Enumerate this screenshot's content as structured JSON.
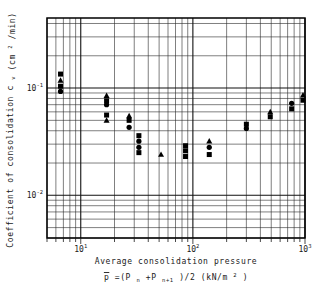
{
  "chart_data": {
    "type": "scatter",
    "title": "",
    "xlabel": "Average consolidation pressure",
    "xlabel_formula_lead": "p",
    "xlabel_formula": "=(P",
    "xlabel_formula_sub1": "n",
    "xlabel_formula_mid": "+P",
    "xlabel_formula_sub2": "n+1",
    "xlabel_formula_tail": ")/2",
    "xlabel_units": "(kN/m",
    "xlabel_units_sup": "2",
    "xlabel_units_tail": ")",
    "ylabel": "Coefficient of consolidation",
    "ylabel_symbol": "c",
    "ylabel_symbol_sub": "v",
    "ylabel_units_open": "(cm",
    "ylabel_units_sup": "2",
    "ylabel_units_close": "/min)",
    "xscale": "log",
    "yscale": "log",
    "xlim": [
      5,
      1000
    ],
    "ylim": [
      0.004,
      0.45
    ],
    "grid": true,
    "legend": "none",
    "xticks": [
      {
        "value": 10,
        "mantissa": "10",
        "exponent": "1"
      },
      {
        "value": 100,
        "mantissa": "10",
        "exponent": "2"
      },
      {
        "value": 1000,
        "mantissa": "10",
        "exponent": "3"
      }
    ],
    "yticks": [
      {
        "value": 0.1,
        "mantissa": "10",
        "exponent": "-1"
      },
      {
        "value": 0.01,
        "mantissa": "10",
        "exponent": "-2"
      }
    ],
    "marker_colors": {
      "all": "#000000"
    },
    "points": [
      {
        "x": 6.6,
        "y": 0.135,
        "marker": "square"
      },
      {
        "x": 6.6,
        "y": 0.118,
        "marker": "triangle"
      },
      {
        "x": 6.6,
        "y": 0.104,
        "marker": "square"
      },
      {
        "x": 6.6,
        "y": 0.093,
        "marker": "circle"
      },
      {
        "x": 17.0,
        "y": 0.085,
        "marker": "triangle"
      },
      {
        "x": 17.0,
        "y": 0.076,
        "marker": "square"
      },
      {
        "x": 17.0,
        "y": 0.07,
        "marker": "circle"
      },
      {
        "x": 17.0,
        "y": 0.056,
        "marker": "square"
      },
      {
        "x": 17.0,
        "y": 0.05,
        "marker": "triangle"
      },
      {
        "x": 27.0,
        "y": 0.055,
        "marker": "triangle"
      },
      {
        "x": 27.0,
        "y": 0.05,
        "marker": "square"
      },
      {
        "x": 27.0,
        "y": 0.043,
        "marker": "circle"
      },
      {
        "x": 33.0,
        "y": 0.036,
        "marker": "square"
      },
      {
        "x": 33.0,
        "y": 0.032,
        "marker": "circle"
      },
      {
        "x": 33.0,
        "y": 0.028,
        "marker": "circle"
      },
      {
        "x": 33.0,
        "y": 0.025,
        "marker": "square"
      },
      {
        "x": 52.0,
        "y": 0.024,
        "marker": "triangle"
      },
      {
        "x": 86.0,
        "y": 0.029,
        "marker": "square"
      },
      {
        "x": 86.0,
        "y": 0.026,
        "marker": "square"
      },
      {
        "x": 86.0,
        "y": 0.023,
        "marker": "square"
      },
      {
        "x": 140.0,
        "y": 0.032,
        "marker": "triangle"
      },
      {
        "x": 140.0,
        "y": 0.028,
        "marker": "circle"
      },
      {
        "x": 140.0,
        "y": 0.024,
        "marker": "square"
      },
      {
        "x": 300.0,
        "y": 0.046,
        "marker": "square"
      },
      {
        "x": 300.0,
        "y": 0.042,
        "marker": "circle"
      },
      {
        "x": 490.0,
        "y": 0.06,
        "marker": "triangle"
      },
      {
        "x": 490.0,
        "y": 0.054,
        "marker": "square"
      },
      {
        "x": 760.0,
        "y": 0.072,
        "marker": "circle"
      },
      {
        "x": 760.0,
        "y": 0.064,
        "marker": "square"
      },
      {
        "x": 960.0,
        "y": 0.086,
        "marker": "triangle"
      },
      {
        "x": 960.0,
        "y": 0.077,
        "marker": "square"
      }
    ]
  }
}
